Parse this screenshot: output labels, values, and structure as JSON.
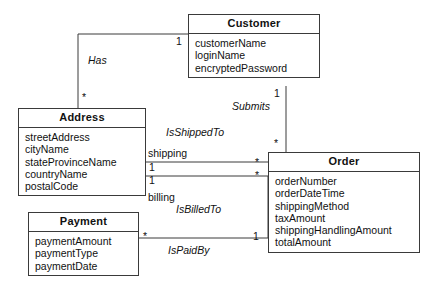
{
  "diagram": {
    "type": "uml-class-diagram",
    "title": "",
    "classes": [
      {
        "id": "customer",
        "name": "Customer",
        "attributes": [
          "customerName",
          "loginName",
          "encryptedPassword"
        ]
      },
      {
        "id": "address",
        "name": "Address",
        "attributes": [
          "streetAddress",
          "cityName",
          "stateProvinceName",
          "countryName",
          "postalCode"
        ]
      },
      {
        "id": "order",
        "name": "Order",
        "attributes": [
          "orderNumber",
          "orderDateTime",
          "shippingMethod",
          "taxAmount",
          "shippingHandlingAmount",
          "totalAmount"
        ]
      },
      {
        "id": "payment",
        "name": "Payment",
        "attributes": [
          "paymentAmount",
          "paymentType",
          "paymentDate"
        ]
      }
    ],
    "associations": [
      {
        "id": "has",
        "label": "Has",
        "from": "customer",
        "to": "address",
        "from_multiplicity": "1",
        "to_multiplicity": "*"
      },
      {
        "id": "submits",
        "label": "Submits",
        "from": "customer",
        "to": "order",
        "from_multiplicity": "1",
        "to_multiplicity": "*"
      },
      {
        "id": "isshippedto",
        "label": "IsShippedTo",
        "from": "order",
        "to": "address",
        "role": "shipping",
        "from_multiplicity": "*",
        "to_multiplicity": "1"
      },
      {
        "id": "isbilledto",
        "label": "IsBilledTo",
        "from": "order",
        "to": "address",
        "role": "billing",
        "from_multiplicity": "*",
        "to_multiplicity": "1"
      },
      {
        "id": "ispaidby",
        "label": "IsPaidBy",
        "from": "order",
        "to": "payment",
        "from_multiplicity": "1",
        "to_multiplicity": "*"
      }
    ],
    "multiplicity_markers": {
      "has_customer_end": "1",
      "has_address_end": "*",
      "submits_customer_end": "1",
      "submits_order_end": "*",
      "shipping_address_end": "1",
      "shipping_order_end": "*",
      "billing_address_end": "1",
      "billing_order_end": "*",
      "ispaidby_payment_end": "*",
      "ispaidby_order_end": "1"
    },
    "roles": {
      "shipping": "shipping",
      "billing": "billing"
    },
    "colors": {
      "line": "#3a3a3a",
      "box_fill": "#ffffff",
      "text": "#111111"
    }
  }
}
